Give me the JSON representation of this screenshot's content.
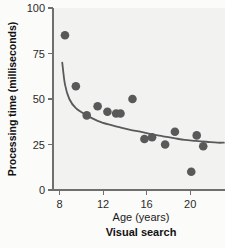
{
  "chart_data": {
    "type": "scatter",
    "title": "Visual search",
    "subtitle": "",
    "xlabel": "Age (years)",
    "ylabel": "Processing time (milliseconds)",
    "xlim": [
      7.4,
      23.2
    ],
    "ylim": [
      0,
      100
    ],
    "xticks": [
      8,
      12,
      16,
      20
    ],
    "yticks": [
      0,
      25,
      50,
      75,
      100
    ],
    "xtick_labels": [
      "8",
      "12",
      "16",
      "20"
    ],
    "ytick_labels": [
      "0",
      "25",
      "50",
      "75",
      "100"
    ],
    "grid": false,
    "legend": "none",
    "point_color": "#595959",
    "curve_color": "#5a5a5a",
    "panel_background": "#f2f2f1",
    "points": [
      {
        "x": 8.5,
        "y": 85
      },
      {
        "x": 9.5,
        "y": 57
      },
      {
        "x": 10.5,
        "y": 41
      },
      {
        "x": 11.5,
        "y": 46
      },
      {
        "x": 12.4,
        "y": 43
      },
      {
        "x": 13.2,
        "y": 42
      },
      {
        "x": 13.6,
        "y": 42
      },
      {
        "x": 14.7,
        "y": 50
      },
      {
        "x": 15.8,
        "y": 28
      },
      {
        "x": 16.5,
        "y": 29
      },
      {
        "x": 17.7,
        "y": 25
      },
      {
        "x": 18.6,
        "y": 32
      },
      {
        "x": 20.1,
        "y": 10
      },
      {
        "x": 20.6,
        "y": 30
      },
      {
        "x": 21.2,
        "y": 24
      }
    ],
    "fit_curve": [
      {
        "x": 8.25,
        "y": 70
      },
      {
        "x": 8.5,
        "y": 58
      },
      {
        "x": 8.9,
        "y": 50
      },
      {
        "x": 9.5,
        "y": 45
      },
      {
        "x": 10.5,
        "y": 41
      },
      {
        "x": 11.5,
        "y": 38
      },
      {
        "x": 12.5,
        "y": 36
      },
      {
        "x": 13.5,
        "y": 34.5
      },
      {
        "x": 14.5,
        "y": 33
      },
      {
        "x": 15.5,
        "y": 32
      },
      {
        "x": 16.5,
        "y": 30.5
      },
      {
        "x": 17.5,
        "y": 29.5
      },
      {
        "x": 18.5,
        "y": 28.5
      },
      {
        "x": 19.5,
        "y": 27.5
      },
      {
        "x": 20.5,
        "y": 27
      },
      {
        "x": 21.5,
        "y": 26.5
      },
      {
        "x": 22.5,
        "y": 26
      },
      {
        "x": 23.1,
        "y": 26
      }
    ]
  }
}
